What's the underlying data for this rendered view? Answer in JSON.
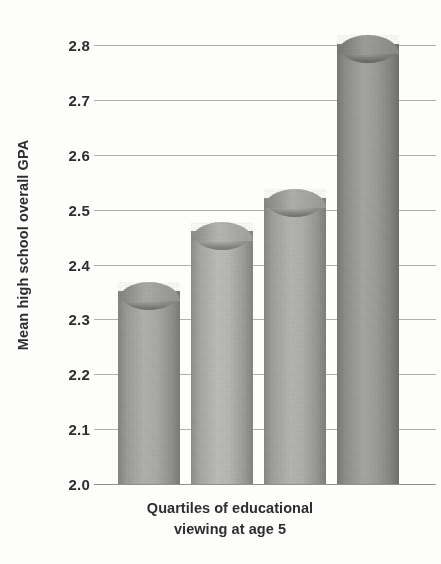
{
  "chart_data": {
    "type": "bar",
    "title": "",
    "subtitle": "",
    "xlabel": "Quartiles of educational viewing at age 5",
    "xlabel_line1": "Quartiles of educational",
    "xlabel_line2": "viewing at age 5",
    "ylabel": "Mean high school overall GPA",
    "categories": [
      "1",
      "2",
      "3",
      "4"
    ],
    "values": [
      2.35,
      2.46,
      2.52,
      2.8
    ],
    "ylim": [
      2.0,
      2.8
    ],
    "ytick_labels": [
      "2.8",
      "2.7",
      "2.6",
      "2.5",
      "2.4",
      "2.3",
      "2.2",
      "2.1",
      "2.0"
    ],
    "ytick_values": [
      2.8,
      2.7,
      2.6,
      2.5,
      2.4,
      2.3,
      2.2,
      2.1,
      2.0
    ],
    "grid": true,
    "grid_axis": "y",
    "legend": false,
    "legend_position": "none",
    "xtick_labels_visible": false,
    "bar_style": "cylinder",
    "bar_colors": [
      "#a8a8a4",
      "#b4b4b0",
      "#adadaa",
      "#9a9a97"
    ],
    "gridline_color": "#9a9a96",
    "text_color": "#2e2e2e",
    "background_color": "#fdfdfc"
  },
  "axis": {
    "y_title": "Mean high school overall GPA",
    "ticks": [
      {
        "label": "2.8",
        "value": 2.8
      },
      {
        "label": "2.7",
        "value": 2.7
      },
      {
        "label": "2.6",
        "value": 2.6
      },
      {
        "label": "2.5",
        "value": 2.5
      },
      {
        "label": "2.4",
        "value": 2.4
      },
      {
        "label": "2.3",
        "value": 2.3
      },
      {
        "label": "2.2",
        "value": 2.2
      },
      {
        "label": "2.1",
        "value": 2.1
      },
      {
        "label": "2.0",
        "value": 2.0
      }
    ]
  },
  "caption": {
    "line1": "Quartiles of educational",
    "line2": "viewing at age 5"
  }
}
